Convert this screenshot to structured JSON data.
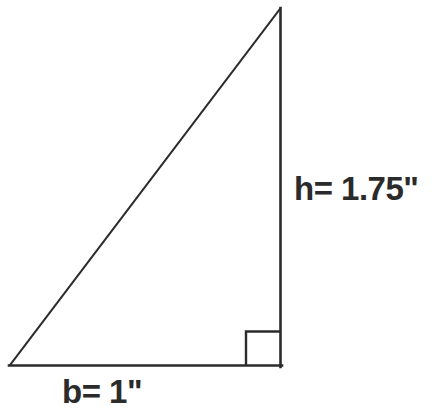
{
  "figure": {
    "background_color": "#ffffff",
    "stroke_color": "#2b2b2b",
    "text_color": "#2b2b2b"
  },
  "labels": {
    "height": "h= 1.75\"",
    "base": "b= 1\""
  },
  "shape": {
    "type": "right-triangle",
    "vertices": {
      "apex": [
        281,
        8
      ],
      "bottom_left": [
        9,
        366
      ],
      "bottom_right": [
        281,
        366
      ]
    },
    "right_angle_marker": {
      "corner": [
        281,
        366
      ],
      "size": 35
    },
    "base_length_label": "b= 1\"",
    "height_length_label": "h= 1.75\"",
    "base_value": 1,
    "height_value": 1.75,
    "units": "inches"
  }
}
